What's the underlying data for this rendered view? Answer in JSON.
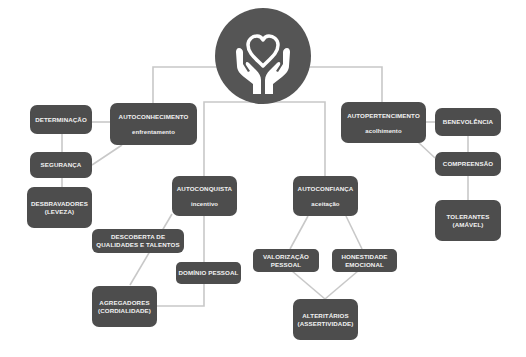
{
  "diagram": {
    "hub": {
      "icon": "hands-holding-heart-icon"
    },
    "colors": {
      "node_fill": "#4d4d4d",
      "node_text": "#f2f2f2",
      "hub_fill": "#555555",
      "connector": "#c8c8c8",
      "background": "#ffffff"
    },
    "nodes": {
      "autoconhecimento": {
        "title": "AUTOCONHECIMENTO",
        "subtitle": "enfrentamento"
      },
      "determinacao": {
        "title": "DETERMINAÇÃO"
      },
      "seguranca": {
        "title": "SEGURANÇA"
      },
      "desbravadores": {
        "line1": "DESBRAVADORES",
        "line2": "(LEVEZA)"
      },
      "autoconquista": {
        "title": "AUTOCONQUISTA",
        "subtitle": "incentivo"
      },
      "descoberta": {
        "line1": "DESCOBERTA DE",
        "line2": "QUALIDADES E TALENTOS"
      },
      "dominio": {
        "title": "DOMÍNIO PESSOAL"
      },
      "agregadores": {
        "line1": "AGREGADORES",
        "line2": "(CORDIALIDADE)"
      },
      "autoconfianca": {
        "title": "AUTOCONFIANÇA",
        "subtitle": "aceitação"
      },
      "valorizacao": {
        "line1": "VALORIZAÇÃO",
        "line2": "PESSOAL"
      },
      "honestidade": {
        "line1": "HONESTIDADE",
        "line2": "EMOCIONAL"
      },
      "alteritarios": {
        "line1": "ALTERITÁRIOS",
        "line2": "(ASSERTIVIDADE)"
      },
      "autopertencimento": {
        "title": "AUTOPERTENCIMENTO",
        "subtitle": "acolhimento"
      },
      "benevolencia": {
        "title": "BENEVOLÊNCIA"
      },
      "compreensao": {
        "title": "COMPREENSÃO"
      },
      "tolerantes": {
        "line1": "TOLERANTES",
        "line2": "(AMÁVEL)"
      }
    }
  }
}
